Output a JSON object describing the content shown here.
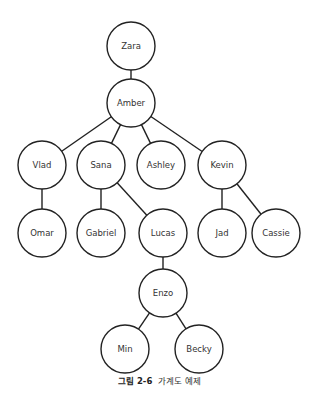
{
  "diagram": {
    "type": "family-tree",
    "stroke_color": "#222222",
    "node_radius": 24,
    "nodes": [
      {
        "id": "zara",
        "label": "Zara",
        "x": 131,
        "y": 46
      },
      {
        "id": "amber",
        "label": "Amber",
        "x": 131,
        "y": 103
      },
      {
        "id": "vlad",
        "label": "Vlad",
        "x": 42,
        "y": 165
      },
      {
        "id": "sana",
        "label": "Sana",
        "x": 101,
        "y": 165
      },
      {
        "id": "ashley",
        "label": "Ashley",
        "x": 161,
        "y": 165
      },
      {
        "id": "kevin",
        "label": "Kevin",
        "x": 222,
        "y": 165
      },
      {
        "id": "omar",
        "label": "Omar",
        "x": 42,
        "y": 233
      },
      {
        "id": "gabriel",
        "label": "Gabriel",
        "x": 101,
        "y": 233
      },
      {
        "id": "lucas",
        "label": "Lucas",
        "x": 163,
        "y": 233
      },
      {
        "id": "jad",
        "label": "Jad",
        "x": 222,
        "y": 233
      },
      {
        "id": "cassie",
        "label": "Cassie",
        "x": 276,
        "y": 233
      },
      {
        "id": "enzo",
        "label": "Enzo",
        "x": 163,
        "y": 293
      },
      {
        "id": "min",
        "label": "Min",
        "x": 125,
        "y": 349
      },
      {
        "id": "becky",
        "label": "Becky",
        "x": 199,
        "y": 349
      }
    ],
    "edges": [
      [
        "zara",
        "amber"
      ],
      [
        "amber",
        "vlad"
      ],
      [
        "amber",
        "sana"
      ],
      [
        "amber",
        "ashley"
      ],
      [
        "amber",
        "kevin"
      ],
      [
        "vlad",
        "omar"
      ],
      [
        "sana",
        "gabriel"
      ],
      [
        "sana",
        "lucas"
      ],
      [
        "kevin",
        "jad"
      ],
      [
        "kevin",
        "cassie"
      ],
      [
        "lucas",
        "enzo"
      ],
      [
        "enzo",
        "min"
      ],
      [
        "enzo",
        "becky"
      ]
    ]
  },
  "caption": {
    "figure_number": "그림 2-6",
    "text": "가계도 예제"
  }
}
